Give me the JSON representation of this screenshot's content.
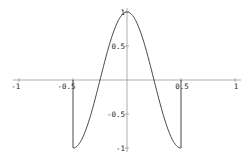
{
  "chart_data": {
    "type": "line",
    "title": "",
    "xlabel": "",
    "ylabel": "",
    "xlim": [
      -1.05,
      1.05
    ],
    "ylim": [
      -1,
      1
    ],
    "grid": false,
    "legend": null,
    "series": [
      {
        "name": "cos(2*pi*x) on [-0.5, 0.5]",
        "x": [
          -0.5,
          -0.45,
          -0.4,
          -0.35,
          -0.3,
          -0.25,
          -0.2,
          -0.15,
          -0.1,
          -0.05,
          0,
          0.05,
          0.1,
          0.15,
          0.2,
          0.25,
          0.3,
          0.35,
          0.4,
          0.45,
          0.5
        ],
        "y": [
          -1,
          -0.951,
          -0.809,
          -0.588,
          -0.309,
          0,
          0.309,
          0.588,
          0.809,
          0.951,
          1,
          0.951,
          0.809,
          0.588,
          0.309,
          0,
          -0.309,
          -0.588,
          -0.809,
          -0.951,
          -1
        ]
      },
      {
        "name": "left vertical edge",
        "x": [
          -0.5,
          -0.5
        ],
        "y": [
          0,
          -1
        ]
      },
      {
        "name": "right vertical edge",
        "x": [
          0.5,
          0.5
        ],
        "y": [
          0,
          -1
        ]
      }
    ],
    "x_ticks": [
      {
        "value": -1,
        "label": "-1"
      },
      {
        "value": -0.5,
        "label": "-0.5"
      },
      {
        "value": 0.5,
        "label": "0.5"
      },
      {
        "value": 1,
        "label": "1"
      }
    ],
    "y_ticks": [
      {
        "value": 1,
        "label": "1"
      },
      {
        "value": 0.5,
        "label": "0.5"
      },
      {
        "value": -0.5,
        "label": "-0.5"
      },
      {
        "value": -1,
        "label": "-1"
      }
    ],
    "colors": {
      "axis": "#9a9a9a",
      "curve": "#333333",
      "text": "#222222",
      "background": "#ffffff"
    }
  }
}
